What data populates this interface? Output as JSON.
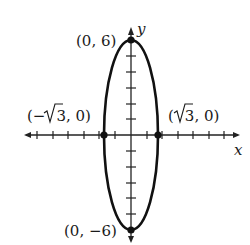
{
  "diagram": {
    "type": "ellipse-graph",
    "equation_hint": "vertical ellipse centered at origin",
    "axes": {
      "x_label": "x",
      "y_label": "y"
    },
    "points": [
      {
        "id": "top",
        "label": "(0, 6)",
        "x": 0,
        "y": 6
      },
      {
        "id": "bottom",
        "label": "(0, −6)",
        "x": 0,
        "y": -6
      },
      {
        "id": "left",
        "label_prefix": "(−",
        "label_root": "3",
        "label_suffix": ", 0)",
        "x": -1.732,
        "y": 0
      },
      {
        "id": "right",
        "label_prefix": "(",
        "label_root": "3",
        "label_suffix": ", 0)",
        "x": 1.732,
        "y": 0
      }
    ],
    "colors": {
      "stroke": "#111111",
      "background": "#ffffff"
    }
  }
}
